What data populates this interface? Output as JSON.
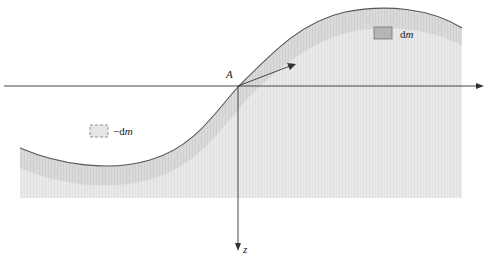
{
  "diagram": {
    "labels": {
      "origin": "A",
      "z_axis": "z",
      "dm_prefix": "d",
      "dm_var": "m",
      "neg_dm_prefix": "−d",
      "neg_dm_var": "m"
    },
    "colors": {
      "fill_dark": "#d9d9d9",
      "fill_light": "#ececec",
      "curve": "#555555",
      "axis": "#333333",
      "mass_box": "#b5b5b5",
      "neg_box": "#e6e6e6"
    }
  }
}
